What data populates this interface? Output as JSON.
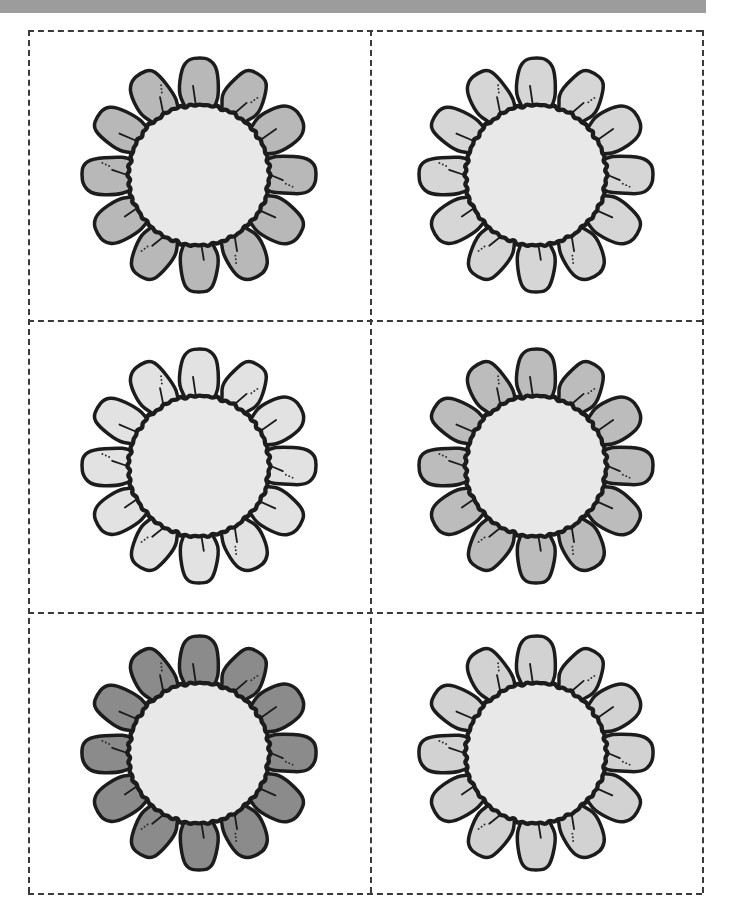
{
  "page": {
    "width": 729,
    "height": 923,
    "background_color": "#ffffff",
    "top_band_color": "#9c9c9c",
    "cut_line_color": "#3a3a3a",
    "cut_line_style": "dashed"
  },
  "layout": {
    "columns": 2,
    "rows": 3,
    "total_cells": 6,
    "cut_sheet": {
      "left": 28,
      "top": 30,
      "width": 674,
      "height": 863
    }
  },
  "flower_style": {
    "petal_count": 12,
    "outline_color": "#1c1c1c",
    "center_fill": "#e8e8e8",
    "center_label": "flower-center-disc",
    "petal_label": "flower-petal"
  },
  "flowers": [
    {
      "id": "flower-1",
      "position": "top-left",
      "row": 1,
      "column": 1,
      "petal_color": "#b8b8b8",
      "center_color": "#e8e8e8",
      "shade_name": "medium-gray",
      "petal_count": 12,
      "size": 250
    },
    {
      "id": "flower-2",
      "position": "top-right",
      "row": 1,
      "column": 2,
      "petal_color": "#d6d6d6",
      "center_color": "#e8e8e8",
      "shade_name": "light-gray",
      "petal_count": 12,
      "size": 250
    },
    {
      "id": "flower-3",
      "position": "middle-left",
      "row": 2,
      "column": 1,
      "petal_color": "#e2e2e2",
      "center_color": "#e8e8e8",
      "shade_name": "very-light-gray",
      "petal_count": 12,
      "size": 250
    },
    {
      "id": "flower-4",
      "position": "middle-right",
      "row": 2,
      "column": 2,
      "petal_color": "#bcbcbc",
      "center_color": "#e8e8e8",
      "shade_name": "medium-gray",
      "petal_count": 12,
      "size": 250
    },
    {
      "id": "flower-5",
      "position": "bottom-left",
      "row": 3,
      "column": 1,
      "petal_color": "#8b8b8b",
      "center_color": "#e8e8e8",
      "shade_name": "dark-gray",
      "petal_count": 12,
      "size": 250
    },
    {
      "id": "flower-6",
      "position": "bottom-right",
      "row": 3,
      "column": 2,
      "petal_color": "#d2d2d2",
      "center_color": "#e8e8e8",
      "shade_name": "light-gray",
      "petal_count": 12,
      "size": 250
    }
  ]
}
